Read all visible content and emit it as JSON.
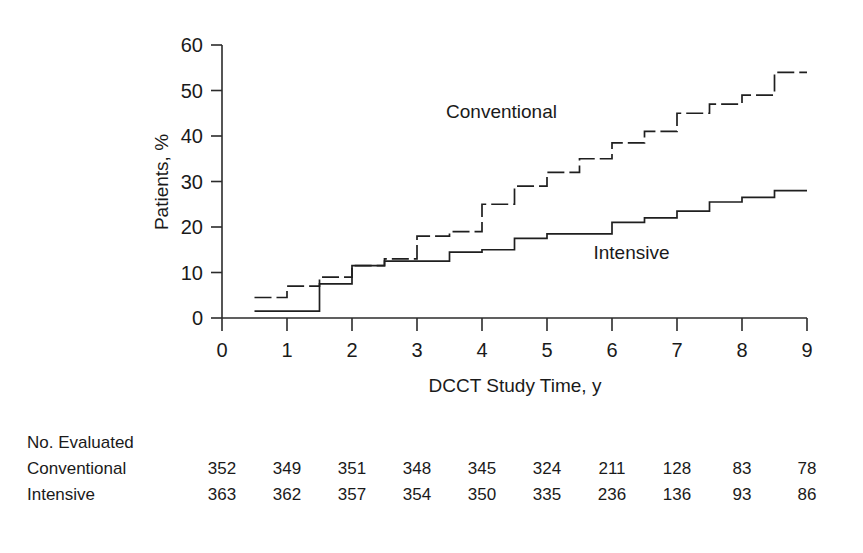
{
  "chart_data": {
    "type": "line",
    "subtype": "step",
    "title": "",
    "xlabel": "DCCT Study Time, y",
    "ylabel": "Patients, %",
    "xlim": [
      0,
      9
    ],
    "ylim": [
      0,
      60
    ],
    "xticks": [
      "0",
      "1",
      "2",
      "3",
      "4",
      "5",
      "6",
      "7",
      "8",
      "9"
    ],
    "yticks": [
      "0",
      "10",
      "20",
      "30",
      "40",
      "50",
      "60"
    ],
    "grid": false,
    "legend_position": "inline-annotations",
    "series": [
      {
        "name": "Conventional",
        "style": "dashed",
        "label_x": 4.3,
        "label_y": 44,
        "x": [
          0.5,
          0.5,
          1.0,
          1.0,
          1.5,
          1.5,
          2.0,
          2.0,
          2.5,
          2.5,
          3.0,
          3.0,
          3.5,
          3.5,
          4.0,
          4.0,
          4.5,
          4.5,
          5.0,
          5.0,
          5.5,
          5.5,
          6.0,
          6.0,
          6.5,
          6.5,
          7.0,
          7.0,
          7.5,
          7.5,
          8.0,
          8.0,
          8.5,
          8.5,
          9.0
        ],
        "y": [
          4.5,
          4.5,
          4.5,
          7.0,
          7.0,
          9.0,
          9.0,
          11.5,
          11.5,
          13.0,
          13.0,
          18.0,
          18.0,
          19.0,
          19.0,
          25.0,
          25.0,
          29.0,
          29.0,
          32.0,
          32.0,
          35.0,
          35.0,
          38.5,
          38.5,
          41.0,
          41.0,
          45.0,
          45.0,
          47.0,
          47.0,
          49.0,
          49.0,
          54.0,
          54.0
        ]
      },
      {
        "name": "Intensive",
        "style": "solid",
        "label_x": 6.3,
        "label_y": 13,
        "x": [
          0.5,
          0.5,
          1.0,
          1.0,
          1.5,
          1.5,
          2.0,
          2.0,
          2.5,
          2.5,
          3.0,
          3.0,
          3.5,
          3.5,
          4.0,
          4.0,
          4.5,
          4.5,
          5.0,
          5.0,
          5.5,
          5.5,
          6.0,
          6.0,
          6.5,
          6.5,
          7.0,
          7.0,
          7.5,
          7.5,
          8.0,
          8.0,
          8.5,
          8.5,
          9.0
        ],
        "y": [
          1.5,
          1.5,
          1.5,
          1.5,
          1.5,
          7.5,
          7.5,
          11.5,
          11.5,
          12.5,
          12.5,
          12.5,
          12.5,
          14.5,
          14.5,
          15.0,
          15.0,
          17.5,
          17.5,
          18.5,
          18.5,
          18.5,
          18.5,
          21.0,
          21.0,
          22.0,
          22.0,
          23.5,
          23.5,
          25.5,
          25.5,
          26.5,
          26.5,
          28.0,
          28.0
        ]
      }
    ]
  },
  "risk_table": {
    "header": "No. Evaluated",
    "columns": [
      "0",
      "1",
      "2",
      "3",
      "4",
      "5",
      "6",
      "7",
      "8",
      "9"
    ],
    "rows": [
      {
        "label": "Conventional",
        "values": [
          "352",
          "349",
          "351",
          "348",
          "345",
          "324",
          "211",
          "128",
          "83",
          "78"
        ]
      },
      {
        "label": "Intensive",
        "values": [
          "363",
          "362",
          "357",
          "354",
          "350",
          "335",
          "236",
          "136",
          "93",
          "86"
        ]
      }
    ]
  },
  "colors": {
    "ink": "#1a1a1a",
    "axis": "#2b2b2b",
    "background": "#ffffff"
  }
}
